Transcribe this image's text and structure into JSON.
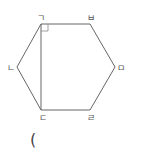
{
  "diagram": {
    "shape": "hexagon",
    "stroke_color": "#666666",
    "vertices": [
      {
        "label": "ㄱ",
        "x": 41,
        "y": 24,
        "lx": 41,
        "ly": 21
      },
      {
        "label": "ㅂ",
        "x": 90,
        "y": 24,
        "lx": 91,
        "ly": 21
      },
      {
        "label": "ㅁ",
        "x": 115,
        "y": 67,
        "lx": 121,
        "ly": 71
      },
      {
        "label": "ㄹ",
        "x": 90,
        "y": 110,
        "lx": 91,
        "ly": 121
      },
      {
        "label": "ㄷ",
        "x": 41,
        "y": 110,
        "lx": 43,
        "ly": 121
      },
      {
        "label": "ㄴ",
        "x": 17,
        "y": 67,
        "lx": 11,
        "ly": 71
      }
    ],
    "diagonal": [
      "ㄱ",
      "ㄷ"
    ],
    "right_angle_at": "ㄱ",
    "answer_paren": "("
  }
}
